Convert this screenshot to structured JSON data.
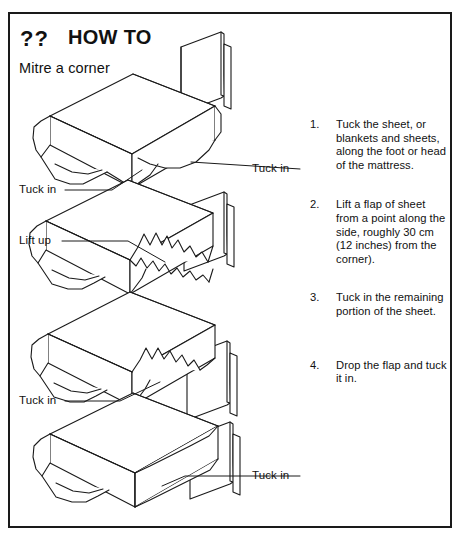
{
  "card": {
    "header": {
      "question_marks": "??",
      "title": "HOW TO",
      "subtitle": "Mitre a corner"
    },
    "illustration": {
      "callouts": [
        {
          "id": "tuck-in-1",
          "label": "Tuck in",
          "side": "right"
        },
        {
          "id": "tuck-in-2",
          "label": "Tuck in",
          "side": "left"
        },
        {
          "id": "lift-up",
          "label": "Lift up",
          "side": "left"
        },
        {
          "id": "tuck-in-3",
          "label": "Tuck in",
          "side": "left"
        },
        {
          "id": "tuck-in-4",
          "label": "Tuck in",
          "side": "right"
        }
      ]
    },
    "steps": [
      {
        "number": "1.",
        "text": "Tuck the sheet, or blankets and sheets, along the foot or head of the mattress."
      },
      {
        "number": "2.",
        "text": "Lift a flap of sheet from a point along the side, roughly 30 cm (12 inches) from the corner)."
      },
      {
        "number": "3.",
        "text": "Tuck in the remaining portion of the sheet."
      },
      {
        "number": "4.",
        "text": "Drop the flap and tuck it in."
      }
    ]
  }
}
